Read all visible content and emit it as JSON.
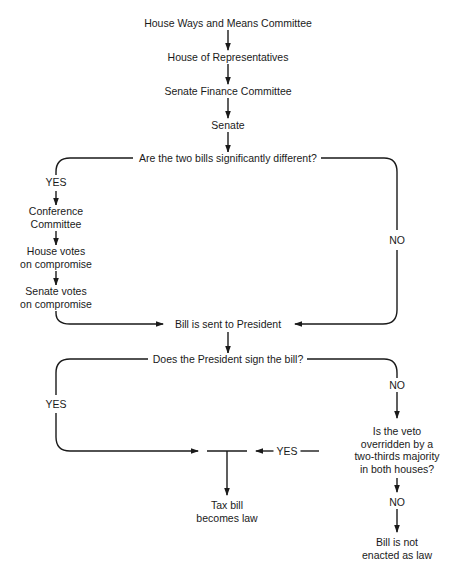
{
  "diagram": {
    "type": "flowchart",
    "title": "",
    "nodes": {
      "ways_means": "House Ways and Means Committee",
      "house": "House of Representatives",
      "senate_finance": "Senate Finance Committee",
      "senate": "Senate",
      "q_different": "Are the two bills significantly different?",
      "conference_1": "Conference",
      "conference_2": "Committee",
      "house_votes_1": "House votes",
      "house_votes_2": "on compromise",
      "senate_votes_1": "Senate votes",
      "senate_votes_2": "on compromise",
      "sent_president": "Bill is sent to President",
      "q_sign": "Does the President sign the bill?",
      "q_override_1": "Is the veto",
      "q_override_2": "overridden by a",
      "q_override_3": "two-thirds majority",
      "q_override_4": "in both houses?",
      "becomes_law_1": "Tax bill",
      "becomes_law_2": "becomes law",
      "not_enacted_1": "Bill is not",
      "not_enacted_2": "enacted as law"
    },
    "edge_labels": {
      "different_yes": "YES",
      "different_no": "NO",
      "sign_yes": "YES",
      "sign_no": "NO",
      "override_yes": "YES",
      "override_no": "NO"
    },
    "edges": [
      [
        "ways_means",
        "house"
      ],
      [
        "house",
        "senate_finance"
      ],
      [
        "senate_finance",
        "senate"
      ],
      [
        "senate",
        "q_different"
      ],
      [
        "q_different",
        "conference",
        "YES"
      ],
      [
        "conference",
        "house_votes"
      ],
      [
        "house_votes",
        "senate_votes"
      ],
      [
        "senate_votes",
        "sent_president"
      ],
      [
        "q_different",
        "sent_president",
        "NO"
      ],
      [
        "sent_president",
        "q_sign"
      ],
      [
        "q_sign",
        "becomes_law",
        "YES"
      ],
      [
        "q_sign",
        "q_override",
        "NO"
      ],
      [
        "q_override",
        "becomes_law",
        "YES"
      ],
      [
        "q_override",
        "not_enacted",
        "NO"
      ]
    ],
    "colors": {
      "line": "#1a1a1a",
      "text": "#1a1a1a",
      "background": "#ffffff"
    }
  }
}
